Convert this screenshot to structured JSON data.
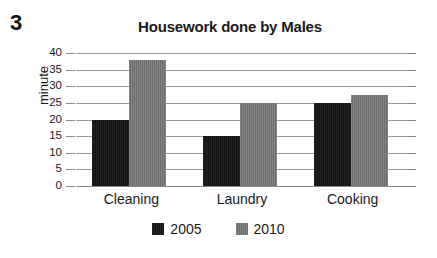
{
  "question_number": "3",
  "chart_data": {
    "type": "bar",
    "title": "Housework done by Males",
    "xlabel": "",
    "ylabel": "minute",
    "categories": [
      "Cleaning",
      "Laundry",
      "Cooking"
    ],
    "series": [
      {
        "name": "2005",
        "color": "#141414",
        "values": [
          20,
          15,
          25
        ]
      },
      {
        "name": "2010",
        "color": "#6d6d6d",
        "values": [
          38,
          25,
          27.5
        ]
      }
    ],
    "ylim": [
      0,
      40
    ],
    "ytick_labels": [
      "40",
      "35",
      "30",
      "25",
      "20",
      "15",
      "10",
      "5",
      "0"
    ],
    "ytick_values": [
      40,
      35,
      30,
      25,
      20,
      15,
      10,
      5,
      0
    ],
    "grid": true,
    "legend_position": "bottom-center"
  }
}
